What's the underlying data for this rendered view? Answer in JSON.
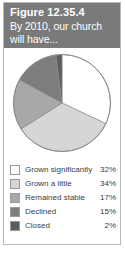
{
  "figure": {
    "number": "Figure 12.35.4",
    "subtitle": "By 2010, our church will have..."
  },
  "colors": {
    "header_background": "#7a7a7a",
    "header_text": "#ffffff",
    "card_border": "#b9b9b9",
    "pie_outline": "#8c8c8c",
    "text": "#3d3d3d"
  },
  "legend": {
    "rows": [
      {
        "label": "Grown significantly",
        "value": "32%",
        "color": "#ffffff"
      },
      {
        "label": "Grown a little",
        "value": "34%",
        "color": "#d6d6d6"
      },
      {
        "label": "Remained stable",
        "value": "17%",
        "color": "#a8a8a8"
      },
      {
        "label": "Declined",
        "value": "15%",
        "color": "#7d7d7d"
      },
      {
        "label": "Closed",
        "value": "2%",
        "color": "#5c5c5c"
      }
    ]
  },
  "chart_data": {
    "type": "pie",
    "title": "By 2010, our church will have...",
    "labels": [
      "Grown significantly",
      "Grown a little",
      "Remained stable",
      "Declined",
      "Closed"
    ],
    "values": [
      32,
      34,
      17,
      15,
      2
    ],
    "value_labels": [
      "32%",
      "34%",
      "17%",
      "15%",
      "2%"
    ],
    "colors": [
      "#ffffff",
      "#d6d6d6",
      "#a8a8a8",
      "#7d7d7d",
      "#5c5c5c"
    ],
    "units": "percent",
    "start_angle_deg": 0,
    "direction": "clockwise",
    "legend_position": "bottom",
    "grid": false
  }
}
